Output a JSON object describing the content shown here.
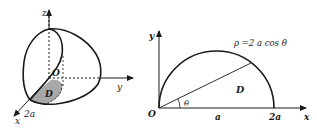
{
  "figure_left": {
    "title": "3D solid over region D",
    "axis_labels": {
      "z": "z",
      "y": "y",
      "x": "x"
    },
    "origin_label": "O",
    "region_label": "D",
    "radius_label": "2a",
    "colors": {
      "stroke": "#1a1a1a",
      "region_fill": "#a8a8a8"
    }
  },
  "figure_right": {
    "title": "Polar region D",
    "axis_labels": {
      "x": "x",
      "y": "y"
    },
    "origin_label": "O",
    "curve_equation": "ρ =2 a cos θ",
    "region_label": "D",
    "angle_label": "θ",
    "tick_labels": [
      "a",
      "2a"
    ],
    "colors": {
      "stroke": "#1a1a1a"
    }
  }
}
